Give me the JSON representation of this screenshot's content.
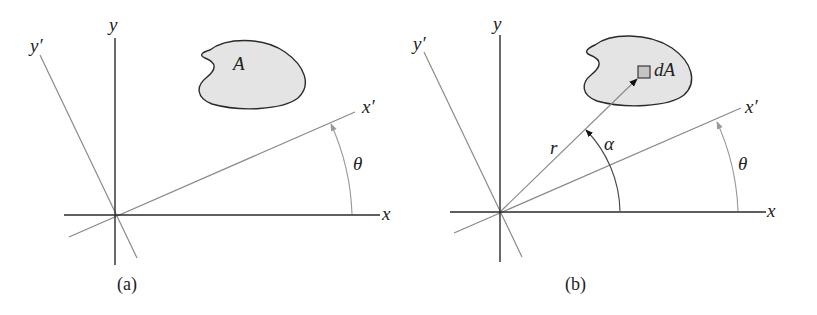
{
  "figure": {
    "panels": [
      {
        "id": "a",
        "caption": "(a)",
        "labels": {
          "x": "x",
          "y": "y",
          "x_prime": "x′",
          "y_prime": "y′",
          "angle": "θ",
          "area": "A"
        }
      },
      {
        "id": "b",
        "caption": "(b)",
        "labels": {
          "x": "x",
          "y": "y",
          "x_prime": "x′",
          "y_prime": "y′",
          "angle_theta": "θ",
          "angle_alpha": "α",
          "radius": "r",
          "element": "dA"
        }
      }
    ],
    "colors": {
      "axis": "#2a2a2a",
      "rotated_axis": "#8a8a8a",
      "area_fill": "#e4e4e4",
      "element_fill": "#c4c4c4",
      "outline": "#2a2a2a"
    }
  }
}
